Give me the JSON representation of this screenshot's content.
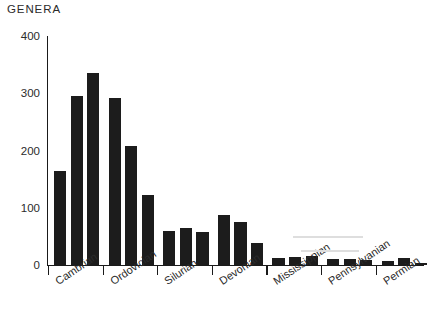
{
  "chart_data": {
    "type": "bar",
    "title": "GENERA",
    "xlabel": "",
    "ylabel": "GENERA",
    "ylim": [
      0,
      400
    ],
    "yticks": [
      0,
      100,
      200,
      300,
      400
    ],
    "ytick_labels": [
      "0",
      "100",
      "200",
      "300",
      "400"
    ],
    "grid": false,
    "legend": null,
    "categories": [
      "Cambrian",
      "Cambrian",
      "Cambrian",
      "Cambrian",
      "Ordovician",
      "Ordovician",
      "Ordovician",
      "Silurian",
      "Silurian",
      "Silurian",
      "Devonian",
      "Devonian",
      "Devonian",
      "Mississippian",
      "Mississippian",
      "Mississippian",
      "Pennsylvanian",
      "Pennsylvanian",
      "Pennsylvanian",
      "Permian",
      "Permian",
      "Permian"
    ],
    "values": [
      165,
      295,
      335,
      292,
      208,
      123,
      60,
      65,
      57,
      88,
      75,
      38,
      13,
      14,
      15,
      10,
      11,
      8,
      7,
      13,
      4,
      2
    ],
    "periods": [
      {
        "name": "Cambrian",
        "values": [
          165,
          295,
          335
        ]
      },
      {
        "name": "Ordovician",
        "values": [
          292,
          208,
          123
        ]
      },
      {
        "name": "Silurian",
        "values": [
          60,
          65,
          57
        ]
      },
      {
        "name": "Devonian",
        "values": [
          88,
          75,
          38
        ]
      },
      {
        "name": "Mississippian",
        "values": [
          13,
          14,
          15
        ]
      },
      {
        "name": "Pennsylvanian",
        "values": [
          10,
          11,
          8
        ]
      },
      {
        "name": "Permian",
        "values": [
          7,
          13,
          4
        ]
      }
    ],
    "bar_color": "#1c1c1c",
    "axis_color": "#1a1a1a"
  },
  "axis": {
    "y_label": "GENERA"
  }
}
